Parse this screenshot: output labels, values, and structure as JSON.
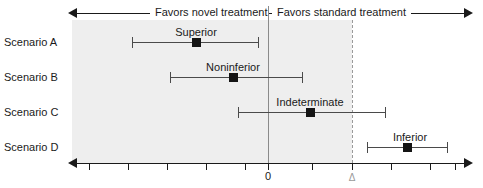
{
  "figure": {
    "type": "forest-plot",
    "header": {
      "left_label": "Favors novel treatment",
      "right_label": "Favors standard treatment",
      "left_arrow_icon": "arrow-left-icon",
      "right_arrow_icon": "arrow-right-icon"
    },
    "axis": {
      "zero_label": "0",
      "delta_label": "Δ",
      "zero_x": 0,
      "delta_x": 2.1,
      "xmin": -4.8,
      "xmax": 5.1,
      "tick_values": [
        -4.5,
        -3.5,
        -2.5,
        -1.5,
        -0.5,
        0,
        1.1,
        2.1,
        3.1,
        4.1,
        5.1
      ],
      "left_arrow_icon": "arrow-left-icon",
      "right_arrow_icon": "arrow-right-icon"
    },
    "shaded_band": {
      "from": -5.0,
      "to": 2.1,
      "color": "#eeeeee",
      "meaning": "non-inferior region"
    },
    "colors": {
      "ink": "#1a1a1a",
      "ci": "#4a4a4a",
      "point": "#141414",
      "zero_line": "#8a8a8a",
      "delta_line": "#9a9a9a",
      "shade": "#eeeeee"
    },
    "rows": [
      {
        "name": "Scenario A",
        "verdict": "Superior",
        "estimate": -1.8,
        "ci_low": -3.4,
        "ci_high": -0.25,
        "px": {
          "low": 132,
          "point": 196,
          "high": 258,
          "label": 196,
          "y": 42,
          "label_y": 26
        }
      },
      {
        "name": "Scenario B",
        "verdict": "Noninferior",
        "estimate": -0.9,
        "ci_low": -2.45,
        "ci_high": 0.85,
        "px": {
          "low": 170,
          "point": 233,
          "high": 302,
          "label": 233,
          "y": 77,
          "label_y": 61
        }
      },
      {
        "name": "Scenario C",
        "verdict": "Indeterminate",
        "estimate": 1.05,
        "ci_low": -0.75,
        "ci_high": 2.95,
        "px": {
          "low": 238,
          "point": 310,
          "high": 385,
          "label": 310,
          "y": 112,
          "label_y": 96
        }
      },
      {
        "name": "Scenario D",
        "verdict": "Inferior",
        "estimate": 3.5,
        "ci_low": 2.5,
        "ci_high": 4.5,
        "px": {
          "low": 367,
          "point": 407,
          "high": 447,
          "label": 410,
          "y": 147,
          "label_y": 131
        }
      }
    ]
  }
}
